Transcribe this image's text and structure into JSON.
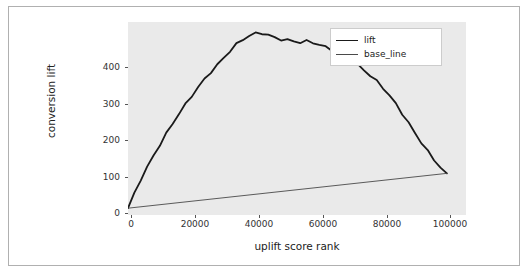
{
  "chart_data": {
    "type": "line",
    "title": "",
    "xlabel": "uplift score rank",
    "ylabel": "conversion lift",
    "xlim": [
      0,
      106000
    ],
    "ylim": [
      -18,
      492
    ],
    "xticks": [
      "0",
      "20000",
      "40000",
      "60000",
      "80000",
      "100000"
    ],
    "yticks": [
      "0",
      "100",
      "200",
      "300",
      "400"
    ],
    "grid": false,
    "legend_position": "upper right",
    "series": [
      {
        "name": "lift",
        "color": "#1a1a1a",
        "x": [
          0,
          2000,
          4000,
          6000,
          8000,
          10000,
          12000,
          14000,
          16000,
          18000,
          20000,
          22000,
          24000,
          26000,
          28000,
          30000,
          32000,
          34000,
          36000,
          38000,
          40000,
          42000,
          44000,
          46000,
          48000,
          50000,
          52000,
          54000,
          56000,
          58000,
          60000,
          62000,
          64000,
          66000,
          68000,
          70000,
          72000,
          74000,
          76000,
          78000,
          80000,
          82000,
          84000,
          86000,
          88000,
          90000,
          92000,
          94000,
          96000,
          98000,
          100000
        ],
        "y": [
          0,
          40,
          78,
          110,
          140,
          168,
          196,
          222,
          248,
          272,
          296,
          320,
          342,
          362,
          380,
          398,
          416,
          432,
          444,
          454,
          460,
          462,
          458,
          452,
          448,
          446,
          442,
          438,
          440,
          436,
          430,
          424,
          418,
          410,
          402,
          392,
          380,
          366,
          350,
          334,
          316,
          296,
          274,
          250,
          226,
          200,
          176,
          152,
          128,
          108,
          92
        ]
      },
      {
        "name": "base_line",
        "color": "#4a4a4a",
        "x": [
          0,
          100000
        ],
        "y": [
          0,
          92
        ]
      }
    ]
  },
  "legend": {
    "items": [
      {
        "label": "lift",
        "color": "#1a1a1a"
      },
      {
        "label": "base_line",
        "color": "#4a4a4a"
      }
    ]
  }
}
